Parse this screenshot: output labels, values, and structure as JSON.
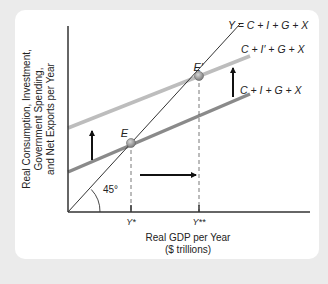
{
  "diagram": {
    "y_axis_label": [
      "Real Consumption, Investment,",
      "Government Spending,",
      "and Net Exports per Year"
    ],
    "x_axis_label": [
      "Real GDP per Year",
      "($ trillions)"
    ],
    "lines": {
      "forty_five": "Y = C + I + G + X",
      "new_aggregate": "C + I′ + G + X",
      "original_aggregate": "C + I + G + X"
    },
    "points": {
      "original_equilibrium": "E",
      "new_equilibrium": "E′"
    },
    "ticks": {
      "y_star": "Y*",
      "y_double_star": "Y**"
    },
    "angle_label": "45°",
    "colors": {
      "background": "#ebebeb",
      "card": "#ffffff",
      "axis": "#333333",
      "original_line": "#8a8a8a",
      "new_line": "#bdbdbd",
      "point": "#9a9a9a"
    }
  }
}
